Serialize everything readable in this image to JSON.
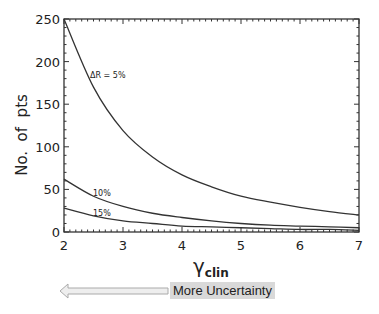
{
  "chart_data": {
    "type": "line",
    "title": "",
    "xlabel": "γ_clin",
    "ylabel": "No. of pts",
    "xlim": [
      2,
      7
    ],
    "ylim": [
      0,
      250
    ],
    "xticks": [
      2,
      3,
      4,
      5,
      6,
      7
    ],
    "yticks": [
      0,
      50,
      100,
      150,
      200,
      250
    ],
    "grid": false,
    "legend": "inline labels",
    "series": [
      {
        "name": "ΔR = 5%",
        "x": [
          2,
          2.5,
          3,
          3.5,
          4,
          4.5,
          5,
          5.5,
          6,
          6.5,
          7
        ],
        "values": [
          250,
          170,
          119,
          88,
          67,
          53,
          42,
          35,
          29,
          24,
          20
        ]
      },
      {
        "name": "10%",
        "x": [
          2,
          2.5,
          3,
          3.5,
          4,
          4.5,
          5,
          5.5,
          6,
          6.5,
          7
        ],
        "values": [
          62,
          42,
          30,
          22,
          17,
          13,
          10,
          8,
          7,
          6,
          5
        ]
      },
      {
        "name": "15%",
        "x": [
          2,
          2.5,
          3,
          3.5,
          4,
          4.5,
          5,
          5.5,
          6,
          6.5,
          7
        ],
        "values": [
          28,
          19,
          13,
          10,
          7,
          6,
          5,
          4,
          3,
          3,
          2
        ]
      }
    ],
    "annotations": [
      "ΔR = 5%",
      "10%",
      "15%"
    ]
  },
  "labels": {
    "ylabel": "No.  of  pts",
    "xlabel_main": "γ",
    "xlabel_sub": "clin",
    "series_5": "ΔR = 5%",
    "series_10": "10%",
    "series_15": "15%",
    "uncertainty": "More Uncertainty"
  },
  "ticks": {
    "x": [
      "2",
      "3",
      "4",
      "5",
      "6",
      "7"
    ],
    "y": [
      "0",
      "50",
      "100",
      "150",
      "200",
      "250"
    ]
  }
}
